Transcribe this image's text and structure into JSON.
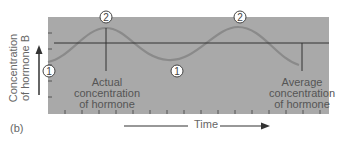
{
  "panel_label": "(b)",
  "y_axis_label": "Concentration of hormone B",
  "x_axis_label": "Time",
  "annotations": {
    "actual": "Actual concentration of hormone",
    "average": "Average concentration of hormone"
  },
  "markers": [
    {
      "id": "1",
      "position": "left trough"
    },
    {
      "id": "2",
      "position": "first peak"
    },
    {
      "id": "1",
      "position": "middle trough"
    },
    {
      "id": "2",
      "position": "second peak"
    }
  ],
  "colors": {
    "plot_background": "#a8a8a8",
    "curve": "#8c8c8c",
    "average_line": "#333333",
    "text": "#5a5a5a"
  }
}
